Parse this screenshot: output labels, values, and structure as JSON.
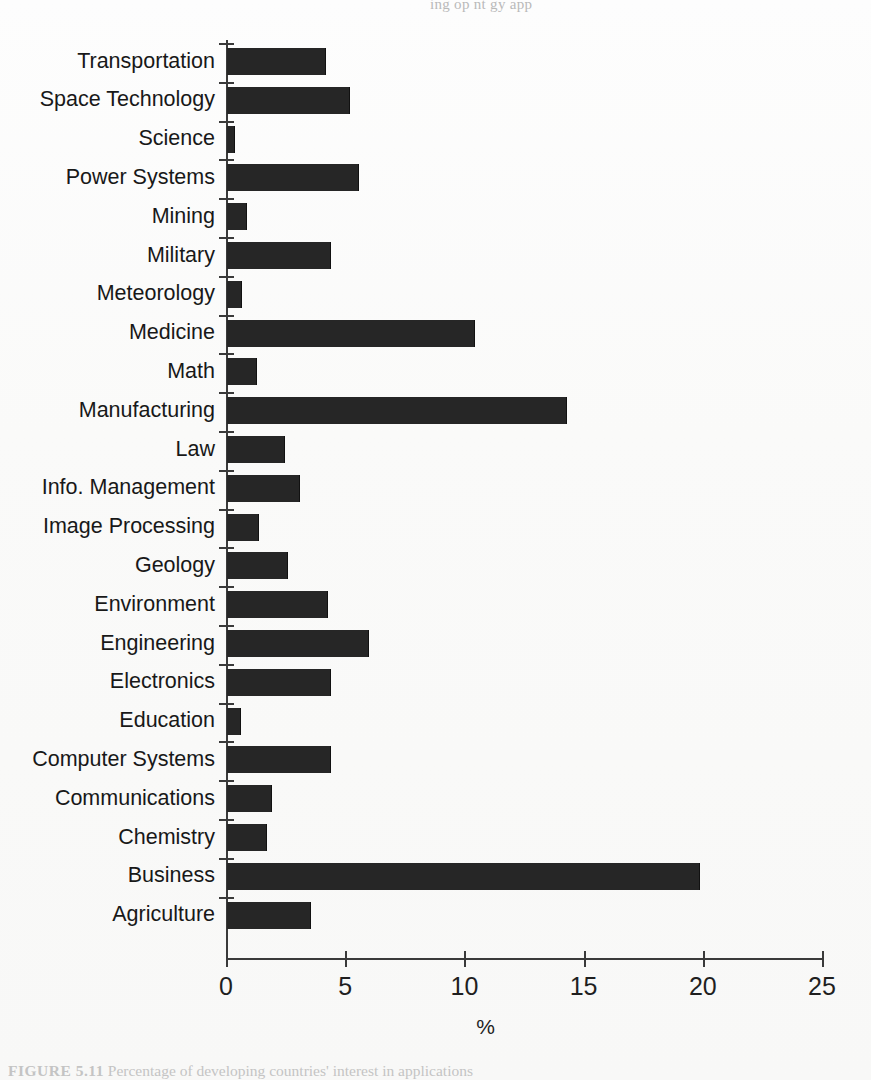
{
  "figure": {
    "top_cut_text": "ing op   nt    gy   app",
    "caption_label": "FIGURE 5.11",
    "caption_text": "Percentage of developing countries' interest in applications"
  },
  "chart_data": {
    "type": "bar",
    "orientation": "horizontal",
    "title": "",
    "xlabel": "%",
    "ylabel": "",
    "xlim": [
      0,
      25
    ],
    "xticks": [
      0,
      5,
      10,
      15,
      20,
      25
    ],
    "xtick_labels": [
      "0",
      "5",
      "10",
      "15",
      "20",
      "25"
    ],
    "grid": false,
    "legend": false,
    "bar_color": "#262626",
    "categories": [
      "Transportation",
      "Space Technology",
      "Science",
      "Power Systems",
      "Mining",
      "Military",
      "Meteorology",
      "Medicine",
      "Math",
      "Manufacturing",
      "Law",
      "Info. Management",
      "Image Processing",
      "Geology",
      "Environment",
      "Engineering",
      "Electronics",
      "Education",
      "Computer Systems",
      "Communications",
      "Chemistry",
      "Business",
      "Agriculture"
    ],
    "values": [
      4.1,
      5.1,
      0.3,
      5.5,
      0.8,
      4.3,
      0.6,
      10.35,
      1.2,
      14.2,
      2.4,
      3.0,
      1.3,
      2.5,
      4.2,
      5.9,
      4.3,
      0.55,
      4.3,
      1.85,
      1.65,
      19.8,
      3.5
    ]
  }
}
